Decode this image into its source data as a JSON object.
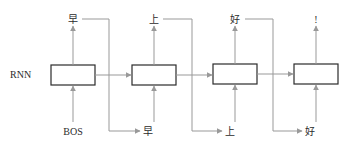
{
  "diagram": {
    "row_label": "RNN",
    "input_start": "BOS",
    "cells": [
      {
        "output": "早",
        "next_input": "早"
      },
      {
        "output": "上",
        "next_input": "上"
      },
      {
        "output": "好",
        "next_input": "好"
      },
      {
        "output": "!"
      }
    ],
    "colors": {
      "box_stroke": "#2b2b2b",
      "arrow": "#999999",
      "text": "#2b2b2b"
    }
  }
}
